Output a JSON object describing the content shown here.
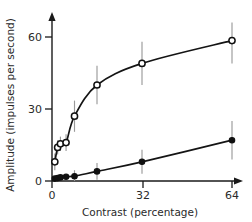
{
  "chart_data": {
    "type": "line",
    "title": "",
    "xlabel": "Contrast (percentage)",
    "ylabel": "Amplitude (impulses per second)",
    "xlim": [
      0,
      70
    ],
    "ylim": [
      0,
      66
    ],
    "xticks": [
      0,
      32,
      64
    ],
    "xticklabels": [
      "0",
      "32",
      "64"
    ],
    "yticks": [
      0,
      30,
      60
    ],
    "yticklabels": [
      "0",
      "30",
      "60"
    ],
    "grid": false,
    "legend": false,
    "axis_arrows": true,
    "series": [
      {
        "name": "open-circles",
        "marker": "open-circle",
        "x": [
          1,
          2,
          3,
          5,
          8,
          16,
          32,
          64
        ],
        "values": [
          8,
          14,
          15.5,
          16,
          27,
          40,
          49,
          58.5
        ],
        "errors": [
          3.5,
          3.0,
          3.0,
          3.5,
          6.5,
          8.0,
          9.0,
          9.5
        ]
      },
      {
        "name": "filled-circles",
        "marker": "filled-circle",
        "x": [
          1,
          2,
          3,
          5,
          8,
          16,
          32,
          64
        ],
        "values": [
          1.0,
          1.2,
          1.5,
          1.8,
          2.0,
          4.0,
          8.0,
          17.0
        ],
        "errors": [
          0.8,
          0.8,
          0.9,
          1.0,
          2.5,
          3.5,
          5.0,
          8.0
        ]
      }
    ]
  },
  "axes": {
    "xlabel": "Contrast (percentage)",
    "ylabel": "Amplitude (impulses per second)",
    "xticklabels": [
      "0",
      "32",
      "64"
    ],
    "yticklabels": [
      "0",
      "30",
      "60"
    ]
  },
  "colors": {
    "axis": "#1a1a1a",
    "curve": "#141414",
    "error_bar": "#9a9a9a",
    "marker_fill_open": "#ffffff",
    "marker_fill_closed": "#101010",
    "background": "#ffffff"
  }
}
